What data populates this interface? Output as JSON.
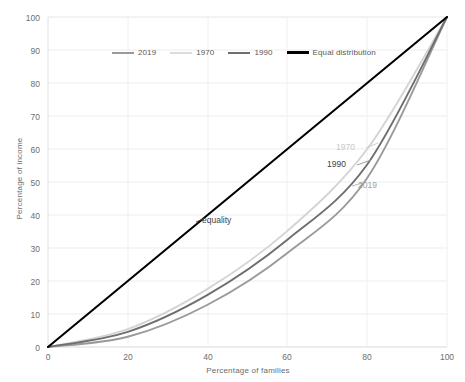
{
  "chart_data": {
    "type": "line",
    "title": "",
    "xlabel": "Percentage of families",
    "ylabel": "Percentage of income",
    "xlim": [
      0,
      100
    ],
    "ylim": [
      0,
      100
    ],
    "xticks": [
      "0",
      "20",
      "40",
      "60",
      "80",
      "100"
    ],
    "yticks": [
      "0",
      "10",
      "20",
      "30",
      "40",
      "50",
      "60",
      "70",
      "80",
      "90",
      "100"
    ],
    "grid": true,
    "legend_position": "top-center",
    "x": [
      0,
      20,
      40,
      60,
      80,
      100
    ],
    "series": [
      {
        "name": "2019",
        "color": "#9a9a9a",
        "values": [
          0,
          3.1,
          12.8,
          28.5,
          51.2,
          100
        ]
      },
      {
        "name": "1970",
        "color": "#d4d4d4",
        "values": [
          0,
          5.4,
          17.6,
          35.2,
          60.0,
          100
        ]
      },
      {
        "name": "1990",
        "color": "#6e6e6e",
        "values": [
          0,
          4.6,
          15.8,
          32.5,
          55.3,
          100
        ]
      },
      {
        "name": "Equal distribution",
        "color": "#000000",
        "values": [
          0,
          20,
          40,
          60,
          80,
          100
        ]
      }
    ],
    "annotations": [
      {
        "text": "1970",
        "x": 80,
        "y": 60.0
      },
      {
        "text": "1990",
        "x": 80,
        "y": 55.3
      },
      {
        "text": "2019",
        "x": 80,
        "y": 51.2
      },
      {
        "text": "equality",
        "x": 41,
        "y": 41
      }
    ]
  },
  "legend": {
    "items": [
      {
        "label": "2019",
        "color": "#9a9a9a"
      },
      {
        "label": "1970",
        "color": "#dcdcdc"
      },
      {
        "label": "1990",
        "color": "#6e6e6e"
      },
      {
        "label": "Equal distribution",
        "color": "#000000"
      }
    ]
  },
  "axes": {
    "y_title": "Percentage of income",
    "x_title": "Percentage of families"
  }
}
